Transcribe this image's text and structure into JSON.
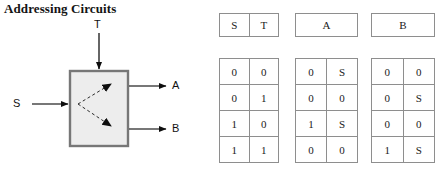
{
  "page": {
    "title": "Addressing Circuits",
    "background_color": "#ffffff",
    "border_color": "#8e8e8e",
    "text_color": "#1a1a1a"
  },
  "diagram": {
    "name": "addressing-circuit-block-diagram",
    "box": {
      "fill_color": "#ededed",
      "border_color": "#777777"
    },
    "inputs": [
      {
        "label": "T",
        "direction": "down",
        "edge": "top"
      },
      {
        "label": "S",
        "direction": "right",
        "edge": "left"
      }
    ],
    "outputs": [
      {
        "label": "A",
        "direction": "right",
        "edge": "right"
      },
      {
        "label": "B",
        "direction": "right",
        "edge": "right"
      }
    ],
    "internal_paths": [
      {
        "style": "dashed",
        "from": "input-S",
        "to": "output-A"
      },
      {
        "style": "dashed",
        "from": "input-S",
        "to": "output-B"
      }
    ]
  },
  "tables": [
    {
      "id": "table-st",
      "headers": [
        "S",
        "T"
      ],
      "header_colspan": 1,
      "rows": [
        [
          "0",
          "0"
        ],
        [
          "0",
          "1"
        ],
        [
          "1",
          "0"
        ],
        [
          "1",
          "1"
        ]
      ]
    },
    {
      "id": "table-a",
      "headers": [
        "A"
      ],
      "header_colspan": 2,
      "rows": [
        [
          "0",
          "S"
        ],
        [
          "0",
          "0"
        ],
        [
          "1",
          "S"
        ],
        [
          "0",
          "0"
        ]
      ]
    },
    {
      "id": "table-b",
      "headers": [
        "B"
      ],
      "header_colspan": 2,
      "rows": [
        [
          "0",
          "0"
        ],
        [
          "0",
          "S"
        ],
        [
          "0",
          "0"
        ],
        [
          "1",
          "S"
        ]
      ]
    }
  ]
}
